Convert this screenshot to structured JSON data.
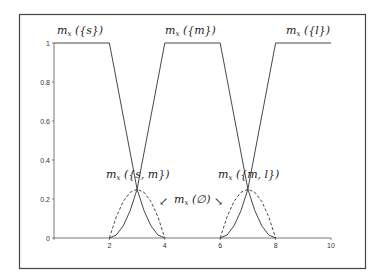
{
  "chart_data": {
    "type": "line",
    "title": "",
    "xlabel": "",
    "ylabel": "",
    "xlim": [
      0,
      10
    ],
    "ylim": [
      0,
      1
    ],
    "grid": false,
    "x_ticks": [
      0,
      2,
      4,
      6,
      8,
      10
    ],
    "x_tick_labels": [
      "",
      "2",
      "4",
      "6",
      "8",
      "10"
    ],
    "y_ticks": [
      0,
      0.2,
      0.4,
      0.6,
      0.8,
      1
    ],
    "y_tick_labels": [
      "0",
      "0.2",
      "0.4",
      "0.6",
      "0.8",
      "1"
    ],
    "series": [
      {
        "name": "m_x({s})",
        "style": "solid",
        "points": [
          [
            0,
            1
          ],
          [
            2,
            1
          ],
          [
            3,
            0.25
          ],
          [
            3.25,
            0.1406
          ],
          [
            3.5,
            0.0625
          ],
          [
            3.75,
            0.0156
          ],
          [
            4,
            0
          ]
        ]
      },
      {
        "name": "m_x({m})",
        "style": "solid",
        "points": [
          [
            2,
            0
          ],
          [
            2.25,
            0.0156
          ],
          [
            2.5,
            0.0625
          ],
          [
            2.75,
            0.1406
          ],
          [
            3,
            0.25
          ],
          [
            4,
            1
          ],
          [
            6,
            1
          ],
          [
            7,
            0.25
          ],
          [
            7.25,
            0.1406
          ],
          [
            7.5,
            0.0625
          ],
          [
            7.75,
            0.0156
          ],
          [
            8,
            0
          ]
        ]
      },
      {
        "name": "m_x({l})",
        "style": "solid",
        "points": [
          [
            6,
            0
          ],
          [
            6.25,
            0.0156
          ],
          [
            6.5,
            0.0625
          ],
          [
            6.75,
            0.1406
          ],
          [
            7,
            0.25
          ],
          [
            8,
            1
          ],
          [
            10,
            1
          ]
        ]
      },
      {
        "name": "m_x({s,m})",
        "style": "dashed",
        "points": [
          [
            2,
            0
          ],
          [
            2.25,
            0.1094
          ],
          [
            2.5,
            0.1875
          ],
          [
            2.75,
            0.2344
          ],
          [
            3,
            0.25
          ],
          [
            3.25,
            0.2344
          ],
          [
            3.5,
            0.1875
          ],
          [
            3.75,
            0.1094
          ],
          [
            4,
            0
          ]
        ]
      },
      {
        "name": "m_x({m,l})",
        "style": "dashed",
        "points": [
          [
            6,
            0
          ],
          [
            6.25,
            0.1094
          ],
          [
            6.5,
            0.1875
          ],
          [
            6.75,
            0.2344
          ],
          [
            7,
            0.25
          ],
          [
            7.25,
            0.2344
          ],
          [
            7.5,
            0.1875
          ],
          [
            7.75,
            0.1094
          ],
          [
            8,
            0
          ]
        ]
      }
    ],
    "annotations": [
      {
        "text": "m_x({s})",
        "x": 0.9,
        "y": 1.05
      },
      {
        "text": "m_x({m})",
        "x": 4.9,
        "y": 1.05
      },
      {
        "text": "m_x({l})",
        "x": 9.0,
        "y": 1.05
      },
      {
        "text": "m_x({s,m})",
        "x": 3.0,
        "y": 0.36
      },
      {
        "text": "m_x({m,l})",
        "x": 7.1,
        "y": 0.36
      },
      {
        "text": "m_x(∅)",
        "x": 5.0,
        "y": 0.2,
        "arrows": "↙ ↘"
      }
    ]
  },
  "labels": {
    "s": {
      "base": "m",
      "sub": "x",
      "arg": " ({s})"
    },
    "m": {
      "base": "m",
      "sub": "x",
      "arg": " ({m})"
    },
    "l": {
      "base": "m",
      "sub": "x",
      "arg": " ({l})"
    },
    "sm": {
      "base": "m",
      "sub": "x",
      "arg": " ({s, m})"
    },
    "ml": {
      "base": "m",
      "sub": "x",
      "arg": " ({m, l})"
    },
    "empty": {
      "base": "m",
      "sub": "x",
      "arg": " (∅)"
    }
  },
  "arrows": {
    "left": "↙",
    "right": "↘"
  },
  "colors": {
    "line": "#333333",
    "frame": "#444444",
    "axis": "#555555"
  }
}
